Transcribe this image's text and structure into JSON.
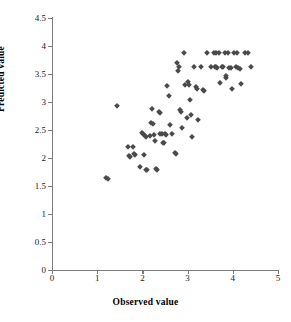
{
  "chart_data": {
    "type": "scatter",
    "title": "",
    "xlabel": "Observed value",
    "ylabel": "Predicted value",
    "xlim": [
      0,
      5
    ],
    "ylim": [
      0,
      4.5
    ],
    "xticks": [
      0,
      1,
      2,
      3,
      4,
      5
    ],
    "yticks": [
      0,
      0.5,
      1,
      1.5,
      2,
      2.5,
      3,
      3.5,
      4,
      4.5
    ],
    "xtick_labels": [
      "0",
      "1",
      "2",
      "3",
      "4",
      "5"
    ],
    "ytick_labels": [
      "0",
      "0.5",
      "1",
      "1.5",
      "2",
      "2.5",
      "3",
      "3.5",
      "4",
      "4.5"
    ],
    "grid": false,
    "legend": false,
    "marker": "diamond",
    "marker_color": "#4a4a4a",
    "series": [
      {
        "name": "Predicted vs Observed",
        "points": [
          [
            1.2,
            1.64
          ],
          [
            1.23,
            1.62
          ],
          [
            1.44,
            2.93
          ],
          [
            1.68,
            2.2
          ],
          [
            1.7,
            2.03
          ],
          [
            1.72,
            2.02
          ],
          [
            1.79,
            2.2
          ],
          [
            1.81,
            2.07
          ],
          [
            1.83,
            2.06
          ],
          [
            1.95,
            1.84
          ],
          [
            2.0,
            2.45
          ],
          [
            2.02,
            2.43
          ],
          [
            2.03,
            2.05
          ],
          [
            2.05,
            2.4
          ],
          [
            2.07,
            2.38
          ],
          [
            2.09,
            1.79
          ],
          [
            2.11,
            1.78
          ],
          [
            2.17,
            2.4
          ],
          [
            2.19,
            2.62
          ],
          [
            2.22,
            2.87
          ],
          [
            2.24,
            2.6
          ],
          [
            2.26,
            2.41
          ],
          [
            2.28,
            2.3
          ],
          [
            2.3,
            1.8
          ],
          [
            2.32,
            1.79
          ],
          [
            2.36,
            2.83
          ],
          [
            2.38,
            2.8
          ],
          [
            2.4,
            2.43
          ],
          [
            2.43,
            2.42
          ],
          [
            2.46,
            2.27
          ],
          [
            2.48,
            2.26
          ],
          [
            2.5,
            2.42
          ],
          [
            2.52,
            2.41
          ],
          [
            2.55,
            3.28
          ],
          [
            2.58,
            3.1
          ],
          [
            2.62,
            2.59
          ],
          [
            2.66,
            2.43
          ],
          [
            2.72,
            2.09
          ],
          [
            2.74,
            2.07
          ],
          [
            2.76,
            3.7
          ],
          [
            2.79,
            3.56
          ],
          [
            2.8,
            3.62
          ],
          [
            2.84,
            2.86
          ],
          [
            2.86,
            2.83
          ],
          [
            2.88,
            2.54
          ],
          [
            2.92,
            3.88
          ],
          [
            2.95,
            3.31
          ],
          [
            2.98,
            2.71
          ],
          [
            3.0,
            3.35
          ],
          [
            3.02,
            3.3
          ],
          [
            3.05,
            3.04
          ],
          [
            3.08,
            2.77
          ],
          [
            3.1,
            2.37
          ],
          [
            3.14,
            3.62
          ],
          [
            3.18,
            3.26
          ],
          [
            3.2,
            3.24
          ],
          [
            3.24,
            2.68
          ],
          [
            3.3,
            3.62
          ],
          [
            3.34,
            3.22
          ],
          [
            3.36,
            3.2
          ],
          [
            3.44,
            3.88
          ],
          [
            3.52,
            3.62
          ],
          [
            3.58,
            3.88
          ],
          [
            3.62,
            3.88
          ],
          [
            3.6,
            3.62
          ],
          [
            3.63,
            3.62
          ],
          [
            3.66,
            3.61
          ],
          [
            3.7,
            3.88
          ],
          [
            3.72,
            3.34
          ],
          [
            3.76,
            3.62
          ],
          [
            3.79,
            3.62
          ],
          [
            3.82,
            3.88
          ],
          [
            3.84,
            3.46
          ],
          [
            3.86,
            3.43
          ],
          [
            3.9,
            3.88
          ],
          [
            3.92,
            3.61
          ],
          [
            3.95,
            3.6
          ],
          [
            3.98,
            3.24
          ],
          [
            4.02,
            3.88
          ],
          [
            4.06,
            3.62
          ],
          [
            4.1,
            3.88
          ],
          [
            4.12,
            3.6
          ],
          [
            4.15,
            3.59
          ],
          [
            4.18,
            3.33
          ],
          [
            4.26,
            3.88
          ],
          [
            4.33,
            3.88
          ],
          [
            4.4,
            3.63
          ]
        ]
      }
    ]
  }
}
